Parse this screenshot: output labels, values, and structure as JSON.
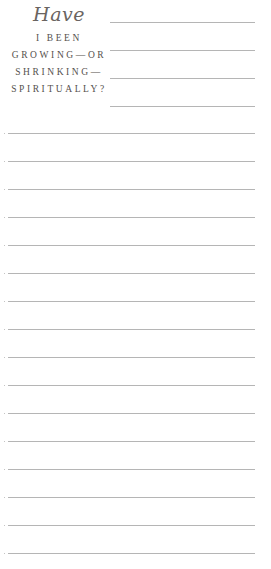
{
  "heading": {
    "script_word": "Have",
    "lines": [
      "I BEEN",
      "GROWING—OR",
      "SHRINKING—",
      "SPIRITUALLY?"
    ]
  },
  "colors": {
    "text": "#55504d",
    "script": "#6a6461",
    "rule": "#b5b5b5",
    "background": "#ffffff"
  },
  "short_rules": {
    "count": 4,
    "x_start": 110,
    "x_end": 255,
    "y_positions": [
      22,
      50,
      78,
      106
    ]
  },
  "full_rules": {
    "count": 16,
    "x_start": 8,
    "x_end": 255,
    "y_positions": [
      133,
      161,
      189,
      217,
      245,
      273,
      301,
      329,
      357,
      385,
      413,
      441,
      469,
      497,
      525,
      553
    ]
  }
}
